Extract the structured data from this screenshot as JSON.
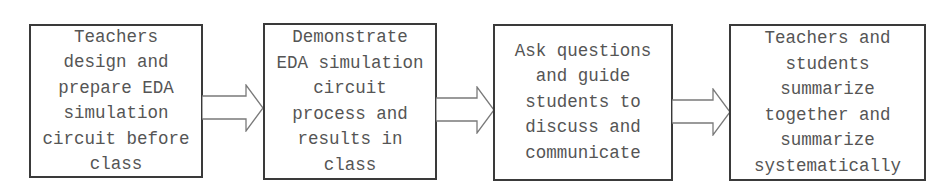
{
  "flowchart": {
    "steps": [
      {
        "id": 1,
        "text": "Teachers\ndesign and\nprepare EDA\nsimulation\ncircuit before\nclass"
      },
      {
        "id": 2,
        "text": "Demonstrate\nEDA simulation\ncircuit\nprocess and\nresults in\nclass"
      },
      {
        "id": 3,
        "text": "Ask questions\nand guide\nstudents to\ndiscuss and\ncommunicate"
      },
      {
        "id": 4,
        "text": "Teachers and\nstudents\nsummarize\ntogether and\nsummarize\nsystematically"
      }
    ],
    "connectors": [
      {
        "from": 1,
        "to": 2,
        "icon": "hollow-right-arrow-icon"
      },
      {
        "from": 2,
        "to": 3,
        "icon": "hollow-right-arrow-icon"
      },
      {
        "from": 3,
        "to": 4,
        "icon": "hollow-right-arrow-icon"
      }
    ],
    "colors": {
      "border": "#3a3a3a",
      "text": "#555555",
      "arrow_stroke": "#7a7a7a",
      "background": "#ffffff"
    }
  }
}
